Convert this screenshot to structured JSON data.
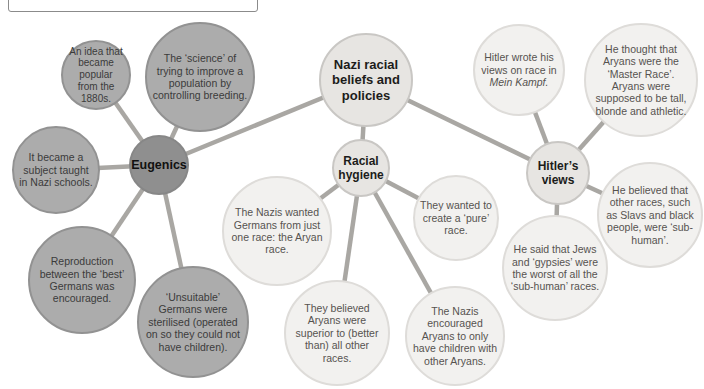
{
  "palette": {
    "background": "#ffffff",
    "connector_line": "#a9a7a3",
    "eugenics_hub_fill": "#8f8f8f",
    "eugenics_satellite_fill": "#acacac",
    "eugenics_satellite_border": "#929292",
    "hub_fill": "#e7e5e2",
    "hub_border": "#c9c7c4",
    "light_satellite_fill": "#f2f1ef",
    "light_satellite_border": "#dedcd9",
    "hub_label_text": "#1c1c1a",
    "gray_satellite_text": "#3b3b3b",
    "light_satellite_text": "#56534f"
  },
  "diagram": {
    "central": {
      "label": "Nazi racial beliefs and policies"
    },
    "eugenics": {
      "label": "Eugenics",
      "satellites": [
        "An idea that became popular from the 1880s.",
        "The ‘science’ of trying to improve a population by controlling breeding.",
        "It became a subject taught in Nazi schools.",
        "Reproduction between the ‘best’ Germans was encouraged.",
        "‘Unsuitable’ Germans were sterilised (operated on so they could not have children)."
      ]
    },
    "racial_hygiene": {
      "label": "Racial hygiene",
      "satellites": [
        "The Nazis wanted Germans from just one race: the Aryan race.",
        "They wanted to create a ‘pure’ race.",
        "They believed Aryans were superior to (better than) all other races.",
        "The Nazis encouraged Aryans to only have children with other Aryans."
      ]
    },
    "hitlers_views": {
      "label": "Hitler’s views",
      "mein_kampf_note": {
        "prefix": "Hitler wrote his views on race in",
        "italic": "Mein Kampf."
      },
      "satellites": [
        "He thought that Aryans were the ‘Master Race’. Aryans were supposed to be tall, blonde and athletic.",
        "He believed that other races, such as Slavs and black people, were ‘sub-human’.",
        "He said that Jews and ‘gypsies’ were the worst of all the ‘sub-human’ races."
      ]
    }
  }
}
